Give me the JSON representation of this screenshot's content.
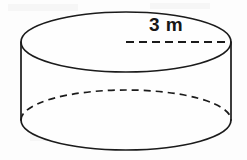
{
  "figure": {
    "name": "cylinder-diagram",
    "shape": "cylinder",
    "stroke_color": "#1b1b1b",
    "fill_color": "#fefefe",
    "background_color": "#fdfdfd"
  },
  "label": {
    "dimension_text": "3 m",
    "value": "3",
    "unit": "m",
    "measures": "radius"
  },
  "geometry": {
    "top_ellipse": {
      "cx": 126,
      "cy": 42,
      "rx": 105,
      "ry": 30,
      "path": "M 21 42 A 105 30 0 1 0 231 42 A 105 30 0 1 0 21 42 Z"
    },
    "bottom_ellipse": {
      "cx": 126,
      "cy": 120,
      "rx": 105,
      "ry": 30,
      "front_arc_path": "M 21 120 A 105 30 0 0 0 231 120",
      "back_arc_path": "M 21 120 A 105 30 0 0 1 231 120"
    },
    "body_path": "M 21 42 L 21 120 A 105 30 0 0 0 231 120 L 231 42 A 105 30 0 0 1 21 42 Z",
    "left_wall": {
      "x": 21,
      "y1": 42,
      "y2": 120
    },
    "right_wall": {
      "x": 231,
      "y1": 42,
      "y2": 120
    },
    "radius_line": {
      "x1": 126,
      "y1": 42,
      "x2": 231,
      "y2": 42
    }
  },
  "canvas": {
    "width": 247,
    "height": 160
  }
}
